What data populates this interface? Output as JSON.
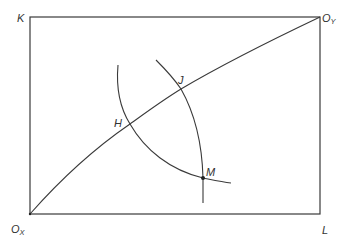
{
  "diagram": {
    "type": "edgeworth-box",
    "stroke_color": "#3a3a3a",
    "box": {
      "x": 30,
      "y": 17,
      "width": 290,
      "height": 197
    },
    "labels": {
      "K": "K",
      "L": "L",
      "OX_main": "O",
      "OX_sub": "X",
      "OY_main": "O",
      "OY_sub": "Y",
      "H": "H",
      "J": "J",
      "M": "M"
    },
    "points": {
      "OX": [
        30,
        214
      ],
      "OY": [
        320,
        17
      ],
      "H": [
        130,
        124
      ],
      "J": [
        181,
        89
      ],
      "M": [
        203,
        178
      ]
    },
    "curves": {
      "contract_curve": "from OX to OY passing through H and J",
      "isoquant_X": "arc through H and M",
      "isoquant_Y": "arc through J and M"
    }
  }
}
